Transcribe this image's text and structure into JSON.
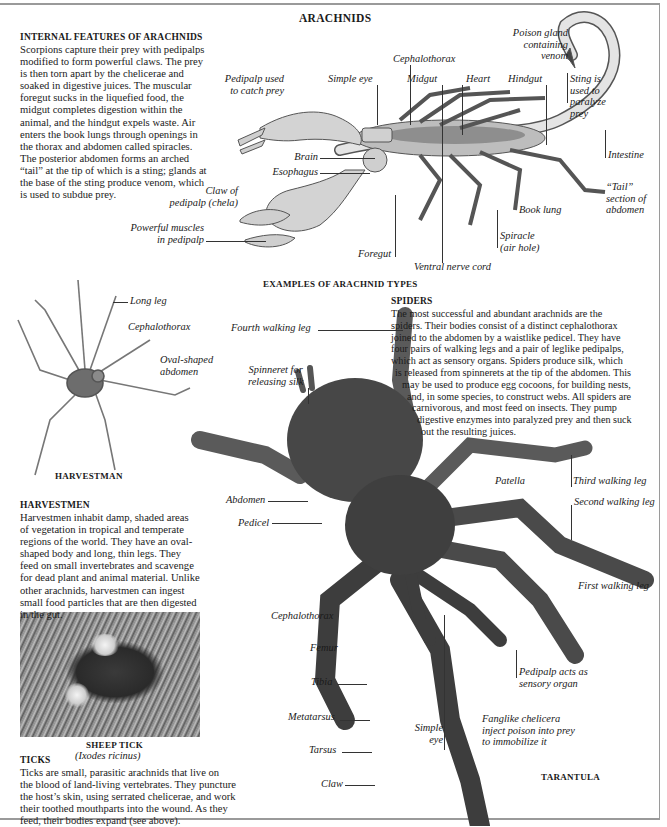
{
  "page": {
    "title": "ARACHNIDS",
    "subtitle": "EXAMPLES OF ARACHNID TYPES"
  },
  "internal_features": {
    "heading": "INTERNAL FEATURES OF ARACHNIDS",
    "lines": [
      "Scorpions capture their prey with pedipalps",
      "modified to form powerful claws. The prey",
      "is then torn apart by the chelicerae and",
      "soaked in digestive juices. The muscular",
      "foregut sucks in the liquefied food, the",
      "midgut completes digestion within the",
      "animal, and the hindgut expels waste. Air",
      "enters the book lungs through openings in",
      "the thorax and abdomen called spiracles.",
      "The posterior abdomen forms an arched",
      "“tail” at the tip of which is a sting; glands at",
      "the base of the sting produce venom, which",
      "is used to subdue prey."
    ]
  },
  "scorpion_labels": {
    "poison_gland": [
      "Poison gland",
      "containing",
      "venom"
    ],
    "cephalothorax": "Cephalothorax",
    "pedipalp_used": [
      "Pedipalp used",
      "to catch prey"
    ],
    "simple_eye": "Simple eye",
    "midgut": "Midgut",
    "heart": "Heart",
    "hindgut": "Hindgut",
    "sting": [
      "Sting is",
      "used to",
      "paralyze",
      "prey"
    ],
    "brain": "Brain",
    "esophagus": "Esophagus",
    "intestine": "Intestine",
    "claw_of_pedipalp": [
      "Claw of",
      "pedipalp (chela)"
    ],
    "tail_section": [
      "“Tail”",
      "section of",
      "abdomen"
    ],
    "book_lung": "Book lung",
    "powerful_muscles": [
      "Powerful muscles",
      "in pedipalp"
    ],
    "spiracle": [
      "Spiracle",
      "(air hole)"
    ],
    "foregut": "Foregut",
    "ventral_nerve_cord": "Ventral nerve cord"
  },
  "harvestman": {
    "labels": {
      "long_leg": "Long leg",
      "cephalothorax": "Cephalothorax",
      "oval_abdomen": [
        "Oval-shaped",
        "abdomen"
      ]
    },
    "caption": "HARVESTMAN",
    "heading": "HARVESTMEN",
    "lines": [
      "Harvestmen inhabit damp, shaded areas",
      "of vegetation in tropical and temperate",
      "regions of the world. They have an oval-",
      "shaped body and long, thin legs. They",
      "feed on small invertebrates and scavenge",
      "for dead plant and animal material. Unlike",
      "other arachnids, harvestmen can ingest",
      "small food particles that are then digested",
      "in the gut."
    ]
  },
  "spiders": {
    "heading": "SPIDERS",
    "lines": [
      "The most successful and abundant arachnids are the",
      "spiders. Their bodies consist of a distinct cephalothorax",
      "joined to the abdomen by a waistlike pedicel. They have",
      "four pairs of walking legs and a pair of leglike pedipalps,",
      "which act as sensory organs. Spiders produce silk, which",
      "is released from spinnerets at the tip of the abdomen. This",
      "may be used to produce egg cocoons, for building nests,",
      "and, in some species, to construct webs. All spiders are",
      "carnivorous, and most feed on insects. They pump",
      "digestive enzymes into paralyzed prey and then suck",
      "out the resulting juices."
    ]
  },
  "tarantula": {
    "caption": "TARANTULA",
    "labels": {
      "fourth_leg": "Fourth walking leg",
      "spinneret": [
        "Spinneret for",
        "releasing silk"
      ],
      "third_leg": "Third walking leg",
      "patella": "Patella",
      "abdomen": "Abdomen",
      "second_leg": "Second walking leg",
      "pedicel": "Pedicel",
      "first_leg": "First walking leg",
      "cephalothorax": "Cephalothorax",
      "femur": "Femur",
      "pedipalp_sensory": [
        "Pedipalp acts as",
        "sensory organ"
      ],
      "tibia": "Tibia",
      "metatarsus": "Metatarsus",
      "simple_eye": [
        "Simple",
        "eye"
      ],
      "fanglike": [
        "Fanglike chelicera",
        "inject poison into prey",
        "to immobilize it"
      ],
      "tarsus": "Tarsus",
      "claw": "Claw"
    }
  },
  "ticks": {
    "photo_caption": "SHEEP TICK",
    "species": "(Ixodes ricinus)",
    "heading": "TICKS",
    "lines": [
      "Ticks are small, parasitic arachnids that live on",
      "the blood of land-living vertebrates. They puncture",
      "the host’s skin, using serrated chelicerae, and work",
      "their toothed mouthparts into the wound. As they",
      "feed, their bodies expand (see above)."
    ]
  },
  "colors": {
    "text": "#1a1a1a",
    "frame": "#9a9a9a",
    "tarantula": "#3d3d3d",
    "scorpion_line": "#555555"
  }
}
